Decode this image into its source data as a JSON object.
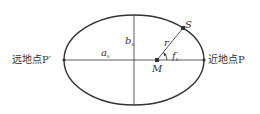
{
  "diagram": {
    "title": "",
    "colors": {
      "stroke": "#333333",
      "background": "#ffffff",
      "text": "#333333"
    },
    "ellipse": {
      "cx": 134,
      "cy": 60,
      "rx": 70,
      "ry": 45
    },
    "labels": {
      "apogee": "远地点P′",
      "perigee": "近地点P",
      "semi_major": "a",
      "semi_major_sub": "s",
      "semi_minor": "b",
      "semi_minor_sub": "s",
      "radius": "r",
      "true_anomaly": "f",
      "true_anomaly_sub": "s",
      "focus": "M",
      "satellite": "S"
    },
    "points": {
      "apogee": {
        "x": 64,
        "y": 60
      },
      "perigee": {
        "x": 204,
        "y": 60
      },
      "focus": {
        "x": 157,
        "y": 60
      },
      "satellite": {
        "x": 183,
        "y": 28
      }
    }
  }
}
